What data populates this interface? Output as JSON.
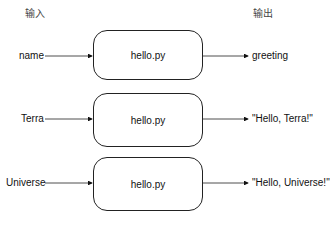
{
  "headers": {
    "input": "输入",
    "output": "输出"
  },
  "rows": [
    {
      "input": "name",
      "program": "hello.py",
      "output": "greeting"
    },
    {
      "input": "Terra",
      "program": "hello.py",
      "output": "\"Hello, Terra!\""
    },
    {
      "input": "Universe",
      "program": "hello.py",
      "output": "\"Hello, Universe!\""
    }
  ]
}
